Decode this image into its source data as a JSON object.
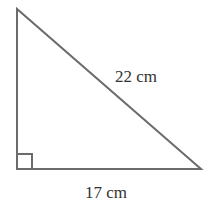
{
  "figure": {
    "type": "right-triangle",
    "stroke_color": "#666666",
    "labels": {
      "hypotenuse": "22 cm",
      "base": "17 cm"
    },
    "right_angle_marker": true
  }
}
